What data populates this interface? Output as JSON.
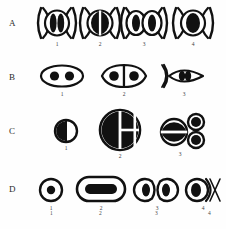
{
  "figure": {
    "rows": [
      {
        "label": "A",
        "panels": [
          {
            "num": "1",
            "name": "spindle-two-chromatid-plate"
          },
          {
            "num": "2",
            "name": "spindle-split-plate"
          },
          {
            "num": "3",
            "name": "spindle-two-daughter-plates"
          },
          {
            "num": "4",
            "name": "spindle-single-dense-plate"
          }
        ]
      },
      {
        "label": "B",
        "panels": [
          {
            "num": "1",
            "name": "oval-two-nuclei"
          },
          {
            "num": "2",
            "name": "paired-cells-two-nuclei"
          },
          {
            "num": "3",
            "name": "lens-cell-twin-lobes"
          }
        ]
      },
      {
        "label": "C",
        "panels": [
          {
            "num": "1",
            "name": "small-half-filled-disc"
          },
          {
            "num": "2",
            "name": "large-quartered-disc"
          },
          {
            "num": "3",
            "name": "bisected-disc-with-two-buds"
          }
        ]
      },
      {
        "label": "D",
        "panels": [
          {
            "num": "1",
            "name": "round-cell-small-nucleus"
          },
          {
            "num": "2",
            "name": "oblong-cell-bar-nucleus"
          },
          {
            "num": "3",
            "name": "dumbbell-dividing-cell"
          },
          {
            "num": "4",
            "name": "cell-with-spindle-arc"
          }
        ]
      }
    ],
    "bottom_numbers": [
      "1",
      "2",
      "3",
      "4"
    ],
    "caption": "",
    "colors": {
      "ink": "#111111",
      "paper": "#fefefe",
      "label": "#2b2b2b"
    }
  }
}
